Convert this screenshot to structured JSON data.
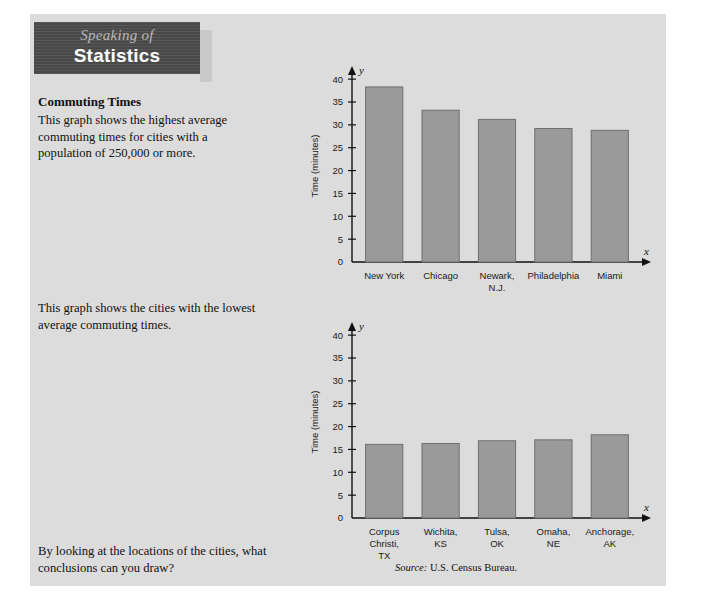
{
  "banner": {
    "line1": "Speaking of",
    "line2": "Statistics"
  },
  "article": {
    "title": "Commuting Times",
    "intro": "This graph shows the highest average commuting times for cities with a population of 250,000 or more.",
    "middle": "This graph shows the cities with the lowest average commuting times.",
    "question": "By looking at the locations of the cities, what conclusions can you draw?",
    "source_prefix": "Source:",
    "source_text": "U.S. Census Bureau."
  },
  "chart_data": [
    {
      "type": "bar",
      "title": "",
      "categories": [
        "New York",
        "Chicago",
        "Newark,\nN.J.",
        "Philadelphia",
        "Miami"
      ],
      "category_lines": [
        [
          "New York"
        ],
        [
          "Chicago"
        ],
        [
          "Newark,",
          "N.J."
        ],
        [
          "Philadelphia"
        ],
        [
          "Miami"
        ]
      ],
      "values": [
        38.3,
        33.2,
        31.2,
        29.2,
        28.8
      ],
      "xlabel": "x",
      "ylabel": "Time (minutes)",
      "yvar": "y",
      "ylim": [
        0,
        42
      ],
      "yticks": [
        0,
        5,
        10,
        15,
        20,
        25,
        30,
        35,
        40
      ],
      "grid": false,
      "bar_color": "#9a9a9a",
      "bar_stroke": "#6f6f6f"
    },
    {
      "type": "bar",
      "title": "",
      "categories": [
        "Corpus\nChristi,\nTX",
        "Wichita,\nKS",
        "Tulsa,\nOK",
        "Omaha,\nNE",
        "Anchorage,\nAK"
      ],
      "category_lines": [
        [
          "Corpus",
          "Christi,",
          "TX"
        ],
        [
          "Wichita,",
          "KS"
        ],
        [
          "Tulsa,",
          "OK"
        ],
        [
          "Omaha,",
          "NE"
        ],
        [
          "Anchorage,",
          "AK"
        ]
      ],
      "values": [
        16.1,
        16.3,
        16.9,
        17.1,
        18.2
      ],
      "xlabel": "x",
      "ylabel": "Time (minutes)",
      "yvar": "y",
      "ylim": [
        0,
        42
      ],
      "yticks": [
        0,
        5,
        10,
        15,
        20,
        25,
        30,
        35,
        40
      ],
      "grid": false,
      "bar_color": "#9a9a9a",
      "bar_stroke": "#6f6f6f"
    }
  ],
  "colors": {
    "panel": "#dcdcdc",
    "banner": "#4d4d4d",
    "bar": "#9a9a9a",
    "axis": "#111111"
  }
}
